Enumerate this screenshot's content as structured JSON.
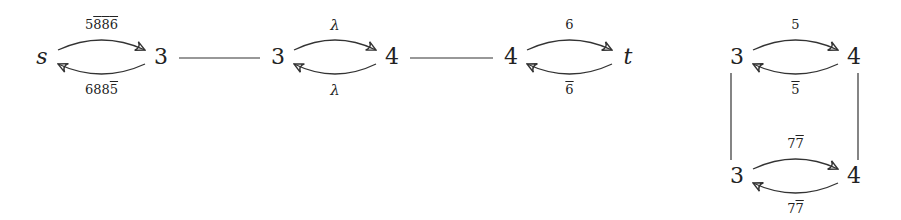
{
  "diagram": {
    "nodes": [
      {
        "id": "s",
        "label": "s",
        "italic": true,
        "x": 42,
        "y": 57
      },
      {
        "id": "n1",
        "label": "3",
        "x": 161,
        "y": 57
      },
      {
        "id": "n2",
        "label": "3",
        "x": 278,
        "y": 57
      },
      {
        "id": "n3",
        "label": "4",
        "x": 392,
        "y": 57
      },
      {
        "id": "n4",
        "label": "4",
        "x": 511,
        "y": 57
      },
      {
        "id": "t",
        "label": "t",
        "italic": true,
        "x": 628,
        "y": 57
      },
      {
        "id": "r1",
        "label": "3",
        "x": 737,
        "y": 57
      },
      {
        "id": "r2",
        "label": "4",
        "x": 854,
        "y": 57
      },
      {
        "id": "r3",
        "label": "3",
        "x": 737,
        "y": 176
      },
      {
        "id": "r4",
        "label": "4",
        "x": 854,
        "y": 176
      }
    ],
    "edges": [
      {
        "from": "s",
        "to": "n1",
        "type": "arrow-over",
        "label": [
          {
            "t": "5"
          },
          {
            "t": "8",
            "bar": true
          },
          {
            "t": "8",
            "bar": true
          },
          {
            "t": "6",
            "bar": true
          }
        ]
      },
      {
        "from": "n1",
        "to": "s",
        "type": "arrow-under",
        "label": [
          {
            "t": "6"
          },
          {
            "t": "8"
          },
          {
            "t": "8"
          },
          {
            "t": "5",
            "bar": true
          }
        ]
      },
      {
        "from": "n1",
        "to": "n2",
        "type": "line"
      },
      {
        "from": "n2",
        "to": "n3",
        "type": "arrow-over",
        "label": [
          {
            "t": "λ",
            "greek": true
          }
        ]
      },
      {
        "from": "n3",
        "to": "n2",
        "type": "arrow-under",
        "label": [
          {
            "t": "λ",
            "greek": true
          }
        ]
      },
      {
        "from": "n3",
        "to": "n4",
        "type": "line"
      },
      {
        "from": "n4",
        "to": "t",
        "type": "arrow-over",
        "label": [
          {
            "t": "6"
          }
        ]
      },
      {
        "from": "t",
        "to": "n4",
        "type": "arrow-under",
        "label": [
          {
            "t": "6",
            "bar": true
          }
        ]
      },
      {
        "from": "r1",
        "to": "r2",
        "type": "arrow-over",
        "label": [
          {
            "t": "5"
          }
        ]
      },
      {
        "from": "r2",
        "to": "r1",
        "type": "arrow-under",
        "label": [
          {
            "t": "5",
            "bar": true
          }
        ]
      },
      {
        "from": "r1",
        "to": "r3",
        "type": "line"
      },
      {
        "from": "r2",
        "to": "r4",
        "type": "line"
      },
      {
        "from": "r3",
        "to": "r4",
        "type": "arrow-over",
        "label": [
          {
            "t": "7"
          },
          {
            "t": "7",
            "bar": true
          }
        ]
      },
      {
        "from": "r4",
        "to": "r3",
        "type": "arrow-under",
        "label": [
          {
            "t": "7"
          },
          {
            "t": "7",
            "bar": true
          }
        ]
      }
    ],
    "colors": {
      "stroke": "#333333",
      "text": "#222222",
      "background": "#ffffff"
    }
  }
}
